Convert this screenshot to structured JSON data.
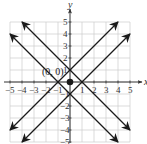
{
  "chart_data": {
    "type": "line",
    "title": "",
    "xlabel": "x",
    "ylabel": "y",
    "xlim": [
      -5,
      5
    ],
    "ylim": [
      -5,
      5
    ],
    "grid": true,
    "x_ticks": [
      -5,
      -4,
      -3,
      -2,
      -1,
      1,
      2,
      3,
      4,
      5
    ],
    "y_ticks": [
      -5,
      -4,
      -3,
      -2,
      -1,
      1,
      2,
      3,
      4,
      5
    ],
    "x_tick_labels": [
      "−5",
      "−4",
      "−3",
      "−2",
      "−1",
      "1",
      "2",
      "3",
      "4",
      "5"
    ],
    "y_tick_labels": [
      "−5",
      "−4",
      "−3",
      "−2",
      "−1",
      "1",
      "2",
      "3",
      "4",
      "5"
    ],
    "series": [
      {
        "name": "y = x + 1",
        "slope": 1,
        "intercept": 1,
        "x": [
          -5,
          4
        ],
        "y": [
          -4,
          5
        ],
        "arrows": "both"
      },
      {
        "name": "y = x - 1",
        "slope": 1,
        "intercept": -1,
        "x": [
          -4,
          5
        ],
        "y": [
          -5,
          4
        ],
        "arrows": "both"
      },
      {
        "name": "y = -x + 1",
        "slope": -1,
        "intercept": 1,
        "x": [
          -4,
          5
        ],
        "y": [
          5,
          -4
        ],
        "arrows": "both"
      },
      {
        "name": "y = -x - 1",
        "slope": -1,
        "intercept": -1,
        "x": [
          -5,
          4
        ],
        "y": [
          4,
          -5
        ],
        "arrows": "both"
      }
    ],
    "points": [
      {
        "x": 0,
        "y": 0,
        "label": "(0, 0)",
        "filled": true
      }
    ],
    "legend": null
  },
  "colors": {
    "line": "#1a1a1a",
    "grid": "#cccccc",
    "axis": "#333333"
  }
}
